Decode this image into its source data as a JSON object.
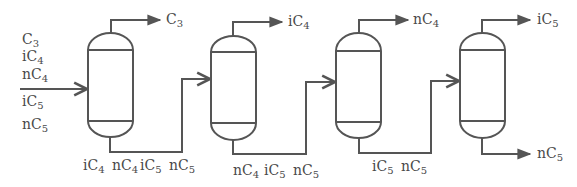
{
  "diagram": {
    "type": "distillation-train",
    "line_color": "#555555",
    "text_color": "#4a4a4a",
    "feed": {
      "components": [
        {
          "base": "C",
          "prefix": "",
          "sub": "3"
        },
        {
          "base": "C",
          "prefix": "i",
          "sub": "4"
        },
        {
          "base": "C",
          "prefix": "n",
          "sub": "4"
        },
        {
          "base": "C",
          "prefix": "i",
          "sub": "5"
        },
        {
          "base": "C",
          "prefix": "n",
          "sub": "5"
        }
      ]
    },
    "columns": [
      {
        "id": 1,
        "overhead": {
          "prefix": "",
          "base": "C",
          "sub": "3"
        },
        "bottoms": [
          {
            "prefix": "i",
            "base": "C",
            "sub": "4"
          },
          {
            "prefix": "n",
            "base": "C",
            "sub": "4"
          },
          {
            "prefix": "i",
            "base": "C",
            "sub": "5"
          },
          {
            "prefix": "n",
            "base": "C",
            "sub": "5"
          }
        ]
      },
      {
        "id": 2,
        "overhead": {
          "prefix": "i",
          "base": "C",
          "sub": "4"
        },
        "bottoms": [
          {
            "prefix": "n",
            "base": "C",
            "sub": "4"
          },
          {
            "prefix": "i",
            "base": "C",
            "sub": "5"
          },
          {
            "prefix": "n",
            "base": "C",
            "sub": "5"
          }
        ]
      },
      {
        "id": 3,
        "overhead": {
          "prefix": "n",
          "base": "C",
          "sub": "4"
        },
        "bottoms": [
          {
            "prefix": "i",
            "base": "C",
            "sub": "5"
          },
          {
            "prefix": "n",
            "base": "C",
            "sub": "5"
          }
        ]
      },
      {
        "id": 4,
        "overhead": {
          "prefix": "i",
          "base": "C",
          "sub": "5"
        },
        "bottoms": [
          {
            "prefix": "n",
            "base": "C",
            "sub": "5"
          }
        ]
      }
    ]
  },
  "labels": {
    "feed_c3": {
      "main": "C",
      "sub": "3"
    },
    "feed_ic4": {
      "main": "iC",
      "sub": "4"
    },
    "feed_nc4": {
      "main": "nC",
      "sub": "4"
    },
    "feed_ic5": {
      "main": "iC",
      "sub": "5"
    },
    "feed_nc5": {
      "main": "nC",
      "sub": "5"
    },
    "col1_top": {
      "main": "C",
      "sub": "3"
    },
    "col1_bot_ic4": {
      "main": "iC",
      "sub": "4"
    },
    "col1_bot_nc4": {
      "main": "nC",
      "sub": "4"
    },
    "col1_bot_ic5": {
      "main": "iC",
      "sub": "5"
    },
    "col1_bot_nc5": {
      "main": "nC",
      "sub": "5"
    },
    "col2_top": {
      "main": "iC",
      "sub": "4"
    },
    "col2_bot_nc4": {
      "main": "nC",
      "sub": "4"
    },
    "col2_bot_ic5": {
      "main": "iC",
      "sub": "5"
    },
    "col2_bot_nc5": {
      "main": "nC",
      "sub": "5"
    },
    "col3_top": {
      "main": "nC",
      "sub": "4"
    },
    "col3_bot_ic5": {
      "main": "iC",
      "sub": "5"
    },
    "col3_bot_nc5": {
      "main": "nC",
      "sub": "5"
    },
    "col4_top": {
      "main": "iC",
      "sub": "5"
    },
    "col4_bot": {
      "main": "nC",
      "sub": "5"
    }
  }
}
